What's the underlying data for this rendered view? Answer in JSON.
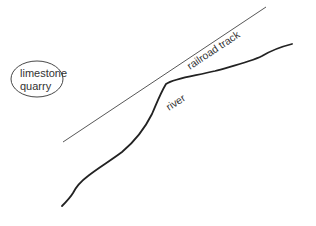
{
  "diagram": {
    "type": "map-sketch",
    "background": "#ffffff",
    "stroke_color": "#222222",
    "features": {
      "quarry": {
        "label_line1": "limestone",
        "label_line2": "quarry",
        "shape": "ellipse"
      },
      "railroad": {
        "label": "railroad track",
        "shape": "straight-line"
      },
      "river": {
        "label": "river",
        "shape": "curved-line"
      }
    }
  }
}
